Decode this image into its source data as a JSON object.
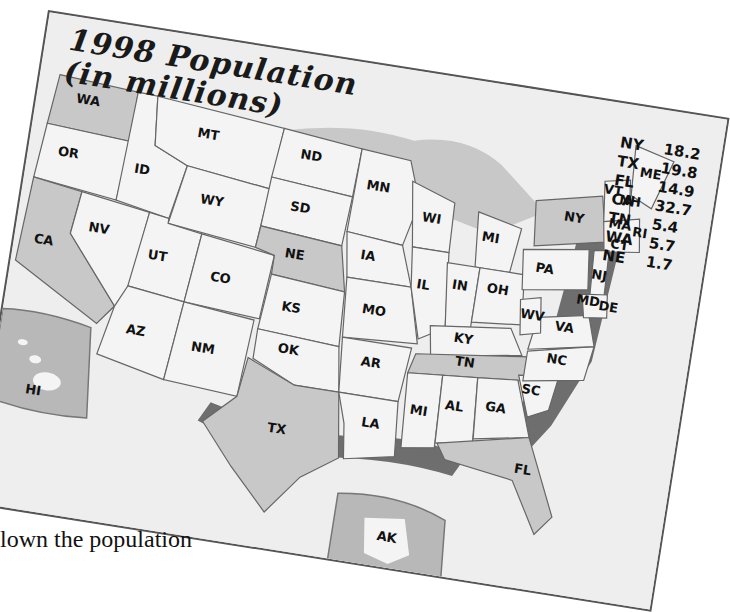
{
  "title": {
    "line1": "1998 Population",
    "line2": "(in millions)"
  },
  "population_list": [
    {
      "state": "NY",
      "value": "18.2"
    },
    {
      "state": "TX",
      "value": "19.8"
    },
    {
      "state": "FL",
      "value": "14.9"
    },
    {
      "state": "CA",
      "value": "32.7"
    },
    {
      "state": "TN",
      "value": "5.4"
    },
    {
      "state": "WA",
      "value": "5.7"
    },
    {
      "state": "NE",
      "value": "1.7"
    }
  ],
  "state_labels": [
    "WA",
    "OR",
    "CA",
    "ID",
    "NV",
    "MT",
    "WY",
    "UT",
    "AZ",
    "CO",
    "NM",
    "ND",
    "SD",
    "NE",
    "KS",
    "OK",
    "TX",
    "MN",
    "IA",
    "MO",
    "AR",
    "LA",
    "WI",
    "IL",
    "MI",
    "IN",
    "OH",
    "KY",
    "TN",
    "MI",
    "AL",
    "GA",
    "FL",
    "SC",
    "NC",
    "VA",
    "WV",
    "PA",
    "NY",
    "VT",
    "NH",
    "ME",
    "MA",
    "RI",
    "CT",
    "NJ",
    "MD",
    "DE",
    "HI",
    "AK"
  ],
  "highlighted_states": [
    "WA",
    "CA",
    "NE",
    "TX",
    "TN",
    "FL",
    "NY"
  ],
  "colors": {
    "land": "#f4f4f4",
    "highlight": "#c8c8c8",
    "water": "#b0b0b0",
    "shadow": "#6e6e6e",
    "border": "#555555"
  },
  "caption": "lown the population"
}
